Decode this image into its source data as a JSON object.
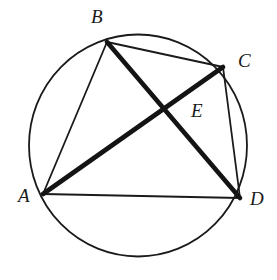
{
  "figure": {
    "background_color": "#ffffff",
    "stroke_color": "#1a1a1a",
    "canvas": {
      "width": 277,
      "height": 280
    },
    "circle": {
      "name": "circumscribed-circle",
      "center_x": 138,
      "center_y": 145.5,
      "radius": 109,
      "stroke_width": 1.8
    },
    "points": [
      {
        "id": "A",
        "label": "A",
        "x": 43,
        "y": 194,
        "label_x": 18,
        "label_y": 186
      },
      {
        "id": "B",
        "label": "B",
        "x": 107,
        "y": 42,
        "label_x": 91,
        "label_y": 7
      },
      {
        "id": "C",
        "label": "C",
        "x": 223,
        "y": 67,
        "label_x": 238,
        "label_y": 51
      },
      {
        "id": "D",
        "label": "D",
        "x": 240,
        "y": 198,
        "label_x": 250,
        "label_y": 189
      },
      {
        "id": "E",
        "label": "E",
        "x": 167,
        "y": 110,
        "label_x": 191,
        "label_y": 101
      }
    ],
    "segments": [
      {
        "id": "AB",
        "from": "A",
        "to": "B",
        "x1": 43,
        "y1": 194,
        "x2": 107,
        "y2": 42,
        "stroke_width": 1.8,
        "style": "thin"
      },
      {
        "id": "BC",
        "from": "B",
        "to": "C",
        "x1": 107,
        "y1": 42,
        "x2": 223,
        "y2": 67,
        "stroke_width": 1.8,
        "style": "thin"
      },
      {
        "id": "CD",
        "from": "C",
        "to": "D",
        "x1": 223,
        "y1": 67,
        "x2": 240,
        "y2": 198,
        "stroke_width": 1.8,
        "style": "thin"
      },
      {
        "id": "AD",
        "from": "A",
        "to": "D",
        "x1": 43,
        "y1": 194,
        "x2": 240,
        "y2": 198,
        "stroke_width": 1.8,
        "style": "thin"
      },
      {
        "id": "BD",
        "from": "B",
        "to": "D",
        "x1": 107,
        "y1": 42,
        "x2": 240,
        "y2": 198,
        "stroke_width": 4.6,
        "style": "thick"
      },
      {
        "id": "AC",
        "from": "A",
        "to": "C",
        "x1": 43,
        "y1": 194,
        "x2": 223,
        "y2": 67,
        "stroke_width": 4.6,
        "style": "thick"
      }
    ],
    "labels": {
      "A": "A",
      "B": "B",
      "C": "C",
      "D": "D",
      "E": "E"
    }
  }
}
